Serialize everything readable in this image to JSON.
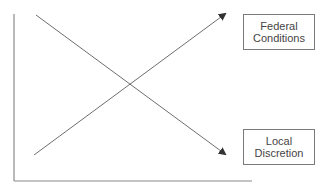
{
  "diagram": {
    "type": "crossing-trend-lines",
    "axes": {
      "y_axis": {
        "x": 14,
        "y1": 14,
        "y2": 181
      },
      "x_axis": {
        "y": 181,
        "x1": 14,
        "x2": 252
      },
      "color": "#8a8a8a"
    },
    "lines": [
      {
        "name": "descending-arrow",
        "x1": 36,
        "y1": 15,
        "x2": 225,
        "y2": 154,
        "color": "#6e6e6e",
        "points_to": "Local Discretion"
      },
      {
        "name": "ascending-arrow",
        "x1": 34,
        "y1": 155,
        "x2": 225,
        "y2": 14,
        "color": "#6e6e6e",
        "points_to": "Federal Conditions"
      }
    ],
    "labels": {
      "federal": {
        "line1": "Federal",
        "line2": "Conditions"
      },
      "local": {
        "line1": "Local",
        "line2": "Discretion"
      }
    }
  }
}
